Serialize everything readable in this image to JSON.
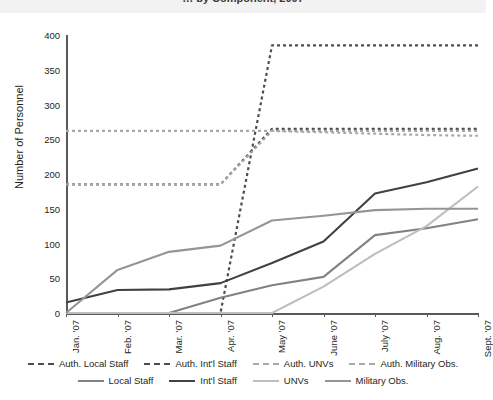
{
  "page": {
    "cut_title": "… by Component, 2007"
  },
  "chart_data": {
    "type": "line",
    "title": "",
    "xlabel": "",
    "ylabel": "Number of Personnel",
    "ylim": [
      0,
      400
    ],
    "ytick_step": 50,
    "yticks": [
      0,
      50,
      100,
      150,
      200,
      250,
      300,
      350,
      400
    ],
    "grid": false,
    "legend_position": "bottom",
    "categories": [
      "Jan. '07",
      "Feb. '07",
      "Mar. '07",
      "Apr. '07",
      "May '07",
      "June '07",
      "July '07",
      "Aug. '07",
      "Sept. '07"
    ],
    "series": [
      {
        "name": "Auth. Local Staff",
        "style": "dashed",
        "color": "#4d4d4d",
        "values": [
          185,
          185,
          185,
          185,
          265,
          265,
          265,
          265,
          265
        ]
      },
      {
        "name": "Auth. Int'l Staff",
        "style": "dashed",
        "color": "#4d4d4d",
        "values": [
          0,
          0,
          0,
          0,
          385,
          385,
          385,
          385,
          385
        ]
      },
      {
        "name": "Auth. UNVs",
        "style": "dashed",
        "color": "#a7a9ac",
        "values": [
          185,
          185,
          185,
          185,
          262,
          260,
          258,
          256,
          255
        ]
      },
      {
        "name": "Auth. Military Obs.",
        "style": "dashed",
        "color": "#a7a9ac",
        "values": [
          262,
          262,
          262,
          262,
          262,
          262,
          262,
          262,
          262
        ]
      },
      {
        "name": "Local Staff",
        "style": "solid",
        "color": "#808285",
        "values": [
          0,
          0,
          0,
          22,
          40,
          52,
          112,
          122,
          135
        ]
      },
      {
        "name": "Int'l Staff",
        "style": "solid",
        "color": "#414042",
        "values": [
          15,
          33,
          34,
          43,
          72,
          103,
          172,
          188,
          208
        ]
      },
      {
        "name": "UNVs",
        "style": "solid",
        "color": "#bcbec0",
        "values": [
          0,
          0,
          0,
          0,
          0,
          38,
          85,
          125,
          182
        ]
      },
      {
        "name": "Military Obs.",
        "style": "solid",
        "color": "#939598",
        "values": [
          0,
          62,
          88,
          97,
          133,
          140,
          148,
          150,
          150
        ]
      }
    ]
  },
  "legend": {
    "row1": [
      {
        "label": "Auth. Local Staff",
        "color": "#4d4d4d",
        "style": "dashed"
      },
      {
        "label": "Auth. Int'l  Staff",
        "color": "#4d4d4d",
        "style": "dashed"
      },
      {
        "label": "Auth. UNVs",
        "color": "#a7a9ac",
        "style": "dashed"
      },
      {
        "label": "Auth. Military Obs.",
        "color": "#a7a9ac",
        "style": "dashed"
      }
    ],
    "row2": [
      {
        "label": "Local Staff",
        "color": "#808285",
        "style": "solid"
      },
      {
        "label": "Int'l Staff",
        "color": "#414042",
        "style": "solid"
      },
      {
        "label": "UNVs",
        "color": "#bcbec0",
        "style": "solid"
      },
      {
        "label": "Military Obs.",
        "color": "#939598",
        "style": "solid"
      }
    ]
  }
}
